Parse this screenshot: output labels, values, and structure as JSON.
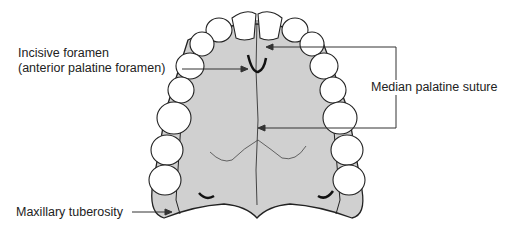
{
  "diagram": {
    "colors": {
      "palate_fill": "#d0d0d0",
      "tooth_fill": "#ffffff",
      "line": "#222222"
    },
    "labels": {
      "incisive_line1": "Incisive foramen",
      "incisive_line2": "(anterior palatine foramen)",
      "median": "Median palatine suture",
      "tuberosity": "Maxillary tuberosity"
    }
  }
}
